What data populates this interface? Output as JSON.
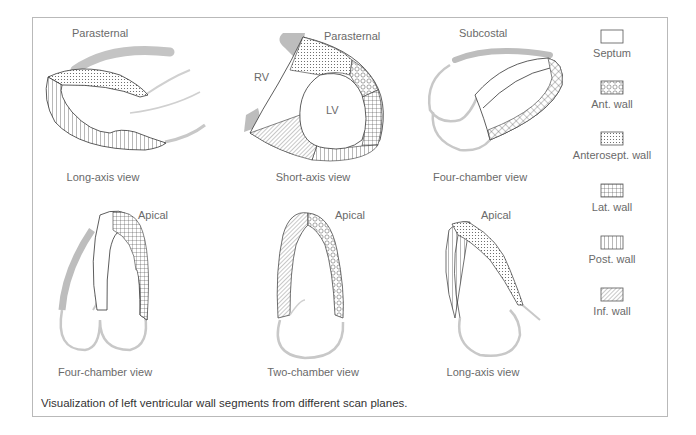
{
  "figure": {
    "caption": "Visualization of left ventricular wall segments from different scan planes.",
    "panels": [
      {
        "id": "top-left",
        "window": "Parasternal",
        "view": "Long-axis view"
      },
      {
        "id": "top-middle",
        "window": "Parasternal",
        "view": "Short-axis view",
        "labels": {
          "rv": "RV",
          "lv": "LV"
        }
      },
      {
        "id": "top-right",
        "window": "Subcostal",
        "view": "Four-chamber view"
      },
      {
        "id": "bottom-left",
        "window": "Apical",
        "view": "Four-chamber view"
      },
      {
        "id": "bottom-middle",
        "window": "Apical",
        "view": "Two-chamber view"
      },
      {
        "id": "bottom-right",
        "window": "Apical",
        "view": "Long-axis view"
      }
    ],
    "legend": [
      {
        "label": "Septum",
        "pattern": "blank"
      },
      {
        "label": "Ant. wall",
        "pattern": "circles"
      },
      {
        "label": "Anterosept. wall",
        "pattern": "fine-dots"
      },
      {
        "label": "Lat. wall",
        "pattern": "grid"
      },
      {
        "label": "Post. wall",
        "pattern": "vertical-lines"
      },
      {
        "label": "Inf. wall",
        "pattern": "diagonal-lines"
      }
    ],
    "colors": {
      "outline": "#333333",
      "gray_structure": "#bdbdbd",
      "frame": "#b9b9b9",
      "text": "#6a6a6a"
    }
  }
}
